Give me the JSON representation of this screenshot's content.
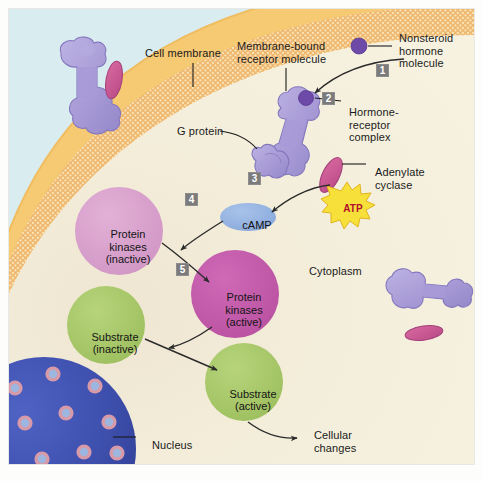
{
  "figure": {
    "background_extracellular": "#d9ecf0",
    "background_cytoplasm": "#f2edd8",
    "membrane_outer": "#f6c973",
    "membrane_inner": "#efc383",
    "protein_purple": "#a79ad6",
    "adenylate_pink": "#cc5e96",
    "kinase_inactive": "#d9a0cc",
    "kinase_active": "#bf57a8",
    "substrate_green": "#a8c86a",
    "nucleus_blue": "#3a4ba8",
    "pore_pink": "#d79aa8",
    "numbox_gray": "#7b7b7b",
    "camp_blue": "#93b2e0",
    "atp_yellow": "#f7e03a",
    "atp_text_red": "#b0102a"
  },
  "labels": {
    "cell_membrane": "Cell membrane",
    "membrane_bound_receptor": "Membrane-bound\nreceptor molecule",
    "nonsteroid_hormone": "Nonsteroid\nhormone\nmolecule",
    "hormone_receptor_complex": "Hormone-\nreceptor\ncomplex",
    "g_protein": "G protein",
    "adenylate_cyclase": "Adenylate\ncyclase",
    "cytoplasm": "Cytoplasm",
    "nucleus": "Nucleus",
    "cellular_changes": "Cellular\nchanges"
  },
  "molecules": {
    "camp": "cAMP",
    "atp": "ATP"
  },
  "bubbles": [
    {
      "id": "protein-kinases-inactive",
      "text": "Protein\nkinases\n(inactive)",
      "color": "#d9a0cc"
    },
    {
      "id": "protein-kinases-active",
      "text": "Protein\nkinases\n(active)",
      "color": "#bf57a8"
    },
    {
      "id": "substrate-inactive",
      "text": "Substrate\n(inactive)",
      "color": "#a8c86a"
    },
    {
      "id": "substrate-active",
      "text": "Substrate\n(active)",
      "color": "#a8c86a"
    }
  ],
  "steps": [
    {
      "number": "1",
      "description": "Nonsteroid hormone molecule arrives at cell surface"
    },
    {
      "number": "2",
      "description": "Hormone binds membrane-bound receptor forming hormone-receptor complex"
    },
    {
      "number": "3",
      "description": "G protein activates adenylate cyclase which converts ATP to cAMP"
    },
    {
      "number": "4",
      "description": "cAMP activates protein kinases"
    },
    {
      "number": "5",
      "description": "Active protein kinases activate substrate producing cellular changes"
    }
  ],
  "icons": {
    "hormone_dot": "hormone-molecule-dot",
    "nucleus": "nucleus-sphere",
    "atp_star": "atp-starburst"
  }
}
